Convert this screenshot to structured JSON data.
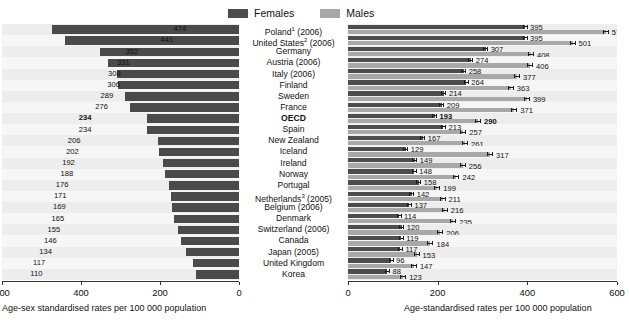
{
  "legend": {
    "items": [
      {
        "label": "Females",
        "color": "#4d4d4d",
        "name": "legend-females"
      },
      {
        "label": "Males",
        "color": "#a8a8a8",
        "name": "legend-males"
      }
    ]
  },
  "axes": {
    "left": {
      "title": "Age-sex standardised rates per 100 000 population",
      "ticks": [
        "600",
        "400",
        "200",
        "0"
      ],
      "tick_values": [
        600,
        400,
        200,
        0
      ],
      "min": 0,
      "max": 600,
      "reversed": true
    },
    "right": {
      "title": "Age-standardised rates per 100 000 population",
      "ticks": [
        "0",
        "200",
        "400",
        "600"
      ],
      "tick_values": [
        0,
        200,
        400,
        600
      ],
      "min": 0,
      "max": 600,
      "reversed": false
    }
  },
  "chart_data": {
    "type": "bar",
    "title": "",
    "subtitle": "",
    "orientation": "horizontal",
    "panels": [
      {
        "name": "total",
        "xlabel": "Age-sex standardised rates per 100 000 population",
        "xlim": [
          0,
          600
        ],
        "reversed_axis": true,
        "series": [
          {
            "name": "Total",
            "color": "#4a4a4a"
          }
        ]
      },
      {
        "name": "by-sex",
        "xlabel": "Age-standardised rates per 100 000 population",
        "xlim": [
          0,
          600
        ],
        "reversed_axis": false,
        "series": [
          {
            "name": "Females",
            "color": "#4d4d4d"
          },
          {
            "name": "Males",
            "color": "#a8a8a8"
          }
        ]
      }
    ],
    "categories": [
      "Poland¹ (2006)",
      "United States² (2006)",
      "Germany",
      "Austria (2006)",
      "Italy (2006)",
      "Finland",
      "Sweden",
      "France",
      "OECD",
      "Spain",
      "New Zealand",
      "Iceland",
      "Ireland",
      "Norway",
      "Portugal",
      "Netherlands³ (2005)",
      "Belgium (2006)",
      "Denmark",
      "Switzerland (2006)",
      "Canada",
      "Japan (2005)",
      "United Kingdom",
      "Korea"
    ],
    "rows": [
      {
        "category": "Poland¹ (2006)",
        "total": 474,
        "females": 395,
        "males": 575,
        "highlight": false
      },
      {
        "category": "United States² (2006)",
        "total": 441,
        "females": 395,
        "males": 501,
        "highlight": false
      },
      {
        "category": "Germany",
        "total": 352,
        "females": 307,
        "males": 408,
        "highlight": false
      },
      {
        "category": "Austria (2006)",
        "total": 331,
        "females": 274,
        "males": 406,
        "highlight": false
      },
      {
        "category": "Italy (2006)",
        "total": 308,
        "females": 258,
        "males": 377,
        "highlight": false
      },
      {
        "category": "Finland",
        "total": 306,
        "females": 264,
        "males": 363,
        "highlight": false
      },
      {
        "category": "Sweden",
        "total": 289,
        "females": 214,
        "males": 399,
        "highlight": false
      },
      {
        "category": "France",
        "total": 276,
        "females": 209,
        "males": 371,
        "highlight": false
      },
      {
        "category": "OECD",
        "total": 234,
        "females": 193,
        "males": 290,
        "highlight": true
      },
      {
        "category": "Spain",
        "total": 234,
        "females": 213,
        "males": 257,
        "highlight": false
      },
      {
        "category": "New Zealand",
        "total": 206,
        "females": 167,
        "males": 261,
        "highlight": false
      },
      {
        "category": "Iceland",
        "total": 202,
        "females": 129,
        "males": 317,
        "highlight": false
      },
      {
        "category": "Ireland",
        "total": 192,
        "females": 149,
        "males": 256,
        "highlight": false
      },
      {
        "category": "Norway",
        "total": 188,
        "females": 148,
        "males": 242,
        "highlight": false
      },
      {
        "category": "Portugal",
        "total": 176,
        "females": 158,
        "males": 199,
        "highlight": false
      },
      {
        "category": "Netherlands³ (2005)",
        "total": 171,
        "females": 142,
        "males": 211,
        "highlight": false
      },
      {
        "category": "Belgium (2006)",
        "total": 169,
        "females": 137,
        "males": 216,
        "highlight": false
      },
      {
        "category": "Denmark",
        "total": 165,
        "females": 114,
        "males": 235,
        "highlight": false
      },
      {
        "category": "Switzerland (2006)",
        "total": 155,
        "females": 120,
        "males": 206,
        "highlight": false
      },
      {
        "category": "Canada",
        "total": 146,
        "females": 119,
        "males": 184,
        "highlight": false
      },
      {
        "category": "Japan (2005)",
        "total": 134,
        "females": 117,
        "males": 153,
        "highlight": false
      },
      {
        "category": "United Kingdom",
        "total": 117,
        "females": 96,
        "males": 147,
        "highlight": false
      },
      {
        "category": "Korea",
        "total": 110,
        "females": 88,
        "males": 123,
        "highlight": false
      }
    ],
    "grid": true,
    "legend_position": "top-right",
    "legend_entries": [
      "Females",
      "Males"
    ]
  }
}
